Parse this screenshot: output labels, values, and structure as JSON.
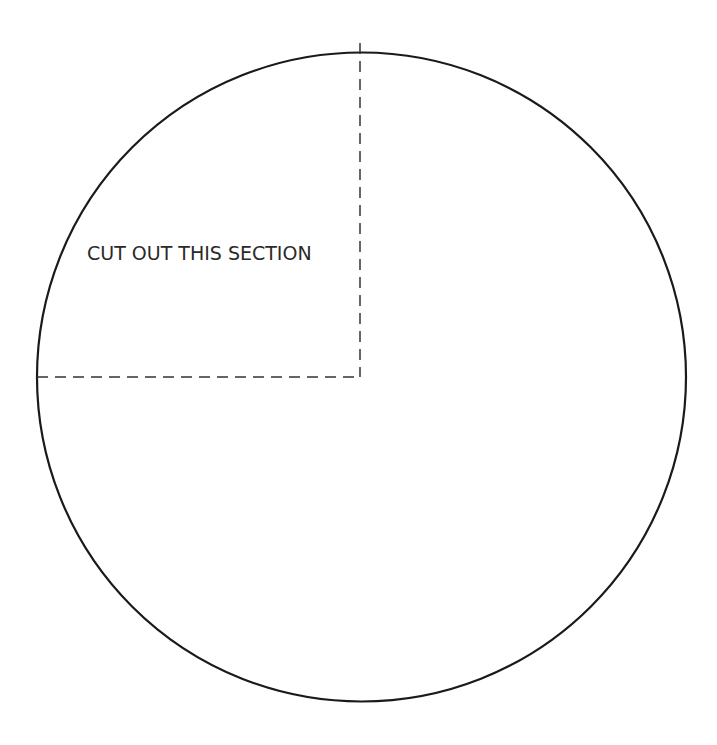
{
  "diagram": {
    "label": "CUT OUT THIS SECTION",
    "colors": {
      "background": "#ffffff",
      "stroke": "#1a1a1a",
      "dash": "#333333",
      "text": "#2a2a2a"
    },
    "circle": {
      "cx": 361,
      "cy": 377,
      "r": 334
    },
    "cut_lines": [
      {
        "name": "vertical",
        "x1": 360,
        "y1": 43,
        "x2": 360,
        "y2": 377
      },
      {
        "name": "horizontal",
        "x1": 37,
        "y1": 377,
        "x2": 360,
        "y2": 377
      }
    ]
  }
}
